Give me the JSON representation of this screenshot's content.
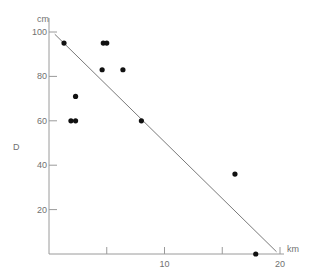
{
  "chart_data": {
    "type": "scatter",
    "title": "",
    "xlabel": "km",
    "ylabel": "D",
    "y_unit": "cm",
    "xlim": [
      0,
      20
    ],
    "ylim": [
      0,
      100
    ],
    "x_ticks": [
      5,
      10,
      15,
      20
    ],
    "x_tick_labels": [
      "",
      "10",
      "",
      "20"
    ],
    "y_ticks": [
      20,
      40,
      60,
      80,
      100
    ],
    "y_tick_labels": [
      "20",
      "40",
      "60",
      "80",
      "100"
    ],
    "grid": false,
    "legend": null,
    "points": [
      {
        "x": 1.3,
        "y": 95
      },
      {
        "x": 4.7,
        "y": 95
      },
      {
        "x": 5.0,
        "y": 95
      },
      {
        "x": 4.6,
        "y": 83
      },
      {
        "x": 6.4,
        "y": 83
      },
      {
        "x": 2.3,
        "y": 71
      },
      {
        "x": 1.9,
        "y": 60
      },
      {
        "x": 2.3,
        "y": 60
      },
      {
        "x": 8.0,
        "y": 60
      },
      {
        "x": 16.1,
        "y": 36
      },
      {
        "x": 17.9,
        "y": 0
      }
    ],
    "fit_line": {
      "x0": 0.5,
      "y0": 99,
      "x1": 19.7,
      "y1": 1
    }
  },
  "labels": {
    "y_unit": "cm",
    "x_unit": "km",
    "y_name": "D"
  }
}
